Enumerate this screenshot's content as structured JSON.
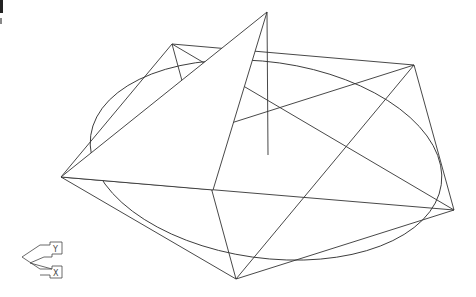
{
  "viewport": {
    "background": "#ffffff",
    "line_color": "#333333",
    "view_type": "3D wireframe"
  },
  "geometry": {
    "pentagon": [
      [
        61,
        177
      ],
      [
        172,
        44
      ],
      [
        414,
        65
      ],
      [
        454,
        210
      ],
      [
        236,
        279
      ]
    ],
    "star": [
      [
        61,
        177
      ],
      [
        414,
        65
      ],
      [
        236,
        279
      ],
      [
        172,
        44
      ],
      [
        454,
        210
      ]
    ],
    "pyramid_face": [
      [
        61,
        177
      ],
      [
        267,
        12
      ],
      [
        213,
        190
      ]
    ],
    "axis_line": [
      [
        267,
        12
      ],
      [
        268,
        155
      ]
    ],
    "ellipse": {
      "cx": 266,
      "cy": 160,
      "rx": 177,
      "ry": 98,
      "rotation": 8
    }
  },
  "ucs_icon": {
    "name": "UCS icon",
    "labels": [
      "Y",
      "X"
    ]
  }
}
